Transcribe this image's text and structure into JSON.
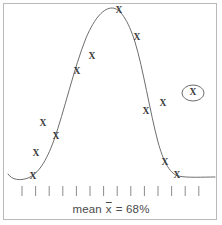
{
  "figure": {
    "title": "",
    "caption_prefix": "mean ",
    "caption_var": "x",
    "caption_suffix": " = 68%",
    "caption_full": "mean x̄ = 68%",
    "border_color": "#b9b9b9",
    "curve_color": "#6e6e6e",
    "mark_color": "#3a3a3a",
    "background": "#ffffff"
  },
  "axis": {
    "tick_count": 14,
    "tick_start_x": 22,
    "tick_spacing": 13.6,
    "tick_top_y": 186,
    "tick_bottom_y": 196,
    "tick_labels": []
  },
  "marks": {
    "label": "X",
    "outlier_label": "X",
    "points": [
      {
        "x": 33,
        "y": 177,
        "name": "datapoint-1"
      },
      {
        "x": 36,
        "y": 154,
        "name": "datapoint-2"
      },
      {
        "x": 43,
        "y": 124,
        "name": "datapoint-3"
      },
      {
        "x": 56,
        "y": 137,
        "name": "datapoint-4"
      },
      {
        "x": 77,
        "y": 72,
        "name": "datapoint-5"
      },
      {
        "x": 92,
        "y": 57,
        "name": "datapoint-6"
      },
      {
        "x": 119,
        "y": 11,
        "name": "datapoint-7"
      },
      {
        "x": 137,
        "y": 38,
        "name": "datapoint-8"
      },
      {
        "x": 146,
        "y": 112,
        "name": "datapoint-9"
      },
      {
        "x": 163,
        "y": 104,
        "name": "datapoint-10"
      },
      {
        "x": 165,
        "y": 163,
        "name": "datapoint-11"
      },
      {
        "x": 177,
        "y": 176,
        "name": "datapoint-12"
      }
    ],
    "outlier": {
      "x": 193,
      "y": 93,
      "rx": 11,
      "ry": 8,
      "name": "outlier-datapoint"
    }
  },
  "chart_data": {
    "type": "line",
    "title": "",
    "subtitle": "",
    "xlabel": "",
    "ylabel": "",
    "annotation": "mean x̄ = 68%",
    "grid": false,
    "legend": "none",
    "curve_name": "normal-distribution-bell-curve",
    "curve_peak": {
      "x": 112,
      "y": 8
    },
    "curve_baseline_y": 177,
    "curve_path": "M 8 174 C 12 180, 20 181, 28 178 C 38 174, 46 162, 54 140 C 64 112, 74 68, 86 38 C 95 17, 104 8, 112 8 C 120 8, 128 20, 135 42 C 143 68, 150 112, 158 142 C 163 160, 169 173, 178 176 C 188 178, 202 177, 215 177",
    "x": [
      8,
      28,
      54,
      86,
      112,
      135,
      158,
      178,
      215
    ],
    "y": [
      174,
      178,
      140,
      38,
      8,
      42,
      142,
      176,
      177
    ],
    "scatter_points": {
      "x": [
        33,
        36,
        43,
        56,
        77,
        92,
        119,
        137,
        146,
        163,
        165,
        177
      ],
      "y": [
        177,
        154,
        124,
        137,
        72,
        57,
        11,
        38,
        112,
        104,
        163,
        176
      ]
    },
    "outlier_point": {
      "x": 193,
      "y": 93,
      "circled": true
    }
  }
}
